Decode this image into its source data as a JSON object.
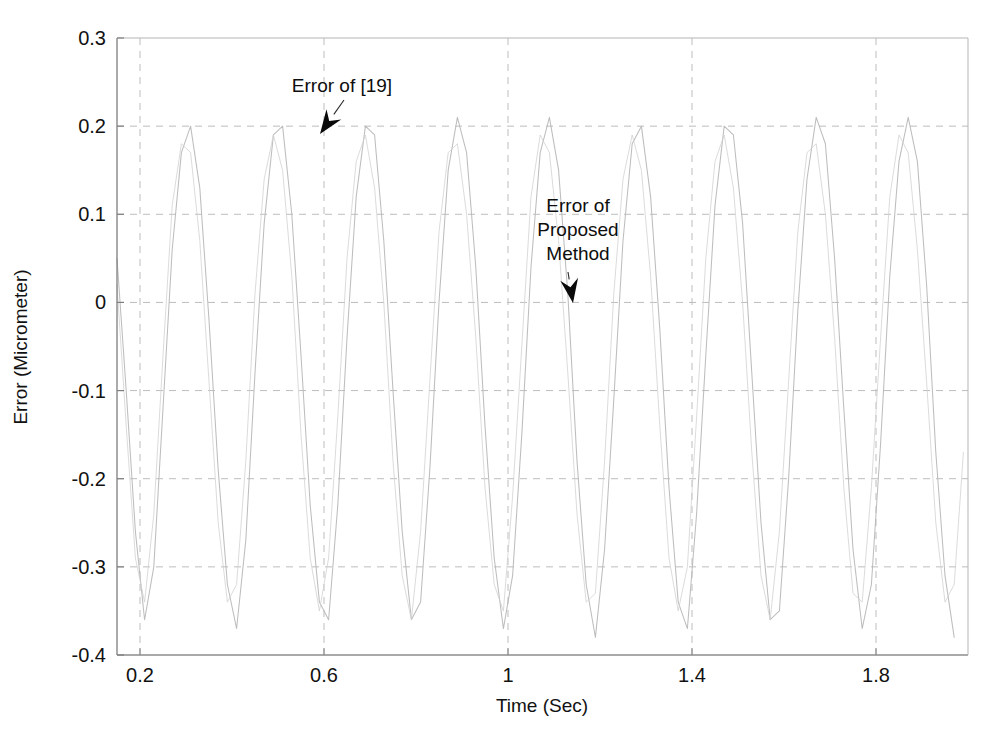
{
  "chart_data": {
    "type": "line",
    "title": "",
    "xlabel": "Time (Sec)",
    "ylabel": "Error (Micrometer)",
    "xlim": [
      0.15,
      2.0
    ],
    "ylim": [
      -0.4,
      0.3
    ],
    "xticks": [
      "0.2",
      "0.6",
      "1",
      "1.4",
      "1.8"
    ],
    "xtick_values": [
      0.2,
      0.6,
      1.0,
      1.4,
      1.8
    ],
    "yticks": [
      "0.3",
      "0.2",
      "0.1",
      "0",
      "-0.1",
      "-0.2",
      "-0.3",
      "-0.4"
    ],
    "ytick_values": [
      0.3,
      0.2,
      0.1,
      0,
      -0.1,
      -0.2,
      -0.3,
      -0.4
    ],
    "grid": true,
    "grid_style": "dashed",
    "legend": "none",
    "series": [
      {
        "name": "Error of [19]",
        "color": "#b9b9b9",
        "period": 0.2,
        "amplitude_max": 0.21,
        "amplitude_min": -0.38,
        "points_t": [
          0.15,
          0.17,
          0.19,
          0.21,
          0.23,
          0.25,
          0.27,
          0.29,
          0.31,
          0.33,
          0.35,
          0.37,
          0.39,
          0.41,
          0.43,
          0.45,
          0.47,
          0.49,
          0.51,
          0.53,
          0.55,
          0.57,
          0.59,
          0.61,
          0.63,
          0.65,
          0.67,
          0.69,
          0.71,
          0.73,
          0.75,
          0.77,
          0.79,
          0.81,
          0.83,
          0.85,
          0.87,
          0.89,
          0.91,
          0.93,
          0.95,
          0.97,
          0.99,
          1.01,
          1.03,
          1.05,
          1.07,
          1.09,
          1.11,
          1.13,
          1.15,
          1.17,
          1.19,
          1.21,
          1.23,
          1.25,
          1.27,
          1.29,
          1.31,
          1.33,
          1.35,
          1.37,
          1.39,
          1.41,
          1.43,
          1.45,
          1.47,
          1.49,
          1.51,
          1.53,
          1.55,
          1.57,
          1.59,
          1.61,
          1.63,
          1.65,
          1.67,
          1.69,
          1.71,
          1.73,
          1.75,
          1.77,
          1.79,
          1.81,
          1.83,
          1.85,
          1.87,
          1.89,
          1.91,
          1.93,
          1.95,
          1.97,
          1.99
        ],
        "points_v": [
          0.05,
          -0.1,
          -0.26,
          -0.36,
          -0.3,
          -0.12,
          0.06,
          0.17,
          0.2,
          0.13,
          -0.02,
          -0.19,
          -0.32,
          -0.37,
          -0.27,
          -0.08,
          0.09,
          0.19,
          0.2,
          0.1,
          -0.06,
          -0.23,
          -0.34,
          -0.36,
          -0.23,
          -0.04,
          0.12,
          0.2,
          0.19,
          0.07,
          -0.1,
          -0.26,
          -0.36,
          -0.34,
          -0.19,
          0.0,
          0.15,
          0.21,
          0.17,
          0.04,
          -0.14,
          -0.29,
          -0.37,
          -0.31,
          -0.15,
          0.04,
          0.17,
          0.21,
          0.15,
          0.01,
          -0.18,
          -0.32,
          -0.38,
          -0.28,
          -0.11,
          0.07,
          0.18,
          0.2,
          0.12,
          -0.03,
          -0.21,
          -0.34,
          -0.37,
          -0.24,
          -0.06,
          0.11,
          0.2,
          0.19,
          0.09,
          -0.08,
          -0.25,
          -0.36,
          -0.35,
          -0.2,
          -0.01,
          0.14,
          0.21,
          0.18,
          0.05,
          -0.12,
          -0.28,
          -0.37,
          -0.32,
          -0.16,
          0.03,
          0.16,
          0.21,
          0.16,
          0.02,
          -0.17,
          -0.31,
          -0.38
        ]
      },
      {
        "name": "Error of Proposed Method",
        "color": "#cfcfcf",
        "period": 0.2,
        "amplitude_max": 0.19,
        "amplitude_min": -0.36,
        "points_t": [
          0.15,
          0.17,
          0.19,
          0.21,
          0.23,
          0.25,
          0.27,
          0.29,
          0.31,
          0.33,
          0.35,
          0.37,
          0.39,
          0.41,
          0.43,
          0.45,
          0.47,
          0.49,
          0.51,
          0.53,
          0.55,
          0.57,
          0.59,
          0.61,
          0.63,
          0.65,
          0.67,
          0.69,
          0.71,
          0.73,
          0.75,
          0.77,
          0.79,
          0.81,
          0.83,
          0.85,
          0.87,
          0.89,
          0.91,
          0.93,
          0.95,
          0.97,
          0.99,
          1.01,
          1.03,
          1.05,
          1.07,
          1.09,
          1.11,
          1.13,
          1.15,
          1.17,
          1.19,
          1.21,
          1.23,
          1.25,
          1.27,
          1.29,
          1.31,
          1.33,
          1.35,
          1.37,
          1.39,
          1.41,
          1.43,
          1.45,
          1.47,
          1.49,
          1.51,
          1.53,
          1.55,
          1.57,
          1.59,
          1.61,
          1.63,
          1.65,
          1.67,
          1.69,
          1.71,
          1.73,
          1.75,
          1.77,
          1.79,
          1.81,
          1.83,
          1.85,
          1.87,
          1.89,
          1.91,
          1.93,
          1.95,
          1.97,
          1.99
        ],
        "points_v": [
          0.02,
          -0.14,
          -0.29,
          -0.34,
          -0.24,
          -0.06,
          0.11,
          0.18,
          0.17,
          0.07,
          -0.09,
          -0.25,
          -0.34,
          -0.32,
          -0.18,
          0.01,
          0.14,
          0.19,
          0.15,
          0.03,
          -0.15,
          -0.29,
          -0.35,
          -0.29,
          -0.13,
          0.05,
          0.16,
          0.19,
          0.13,
          0.0,
          -0.18,
          -0.31,
          -0.36,
          -0.26,
          -0.09,
          0.08,
          0.17,
          0.18,
          0.1,
          -0.04,
          -0.21,
          -0.32,
          -0.35,
          -0.22,
          -0.05,
          0.12,
          0.19,
          0.17,
          0.07,
          -0.08,
          -0.24,
          -0.34,
          -0.33,
          -0.18,
          0.01,
          0.14,
          0.19,
          0.15,
          0.03,
          -0.14,
          -0.29,
          -0.35,
          -0.3,
          -0.13,
          0.05,
          0.16,
          0.19,
          0.13,
          0.0,
          -0.17,
          -0.31,
          -0.36,
          -0.26,
          -0.09,
          0.08,
          0.17,
          0.18,
          0.1,
          -0.04,
          -0.21,
          -0.33,
          -0.34,
          -0.21,
          -0.04,
          0.12,
          0.19,
          0.17,
          0.06,
          -0.09,
          -0.25,
          -0.34,
          -0.32,
          -0.17
        ]
      }
    ],
    "annotations": [
      {
        "id": "annotation-error-of-19",
        "text_lines": [
          "Error of [19]"
        ],
        "text_x": 342,
        "text_y": 92,
        "arrow_from_x": 344,
        "arrow_from_y": 100,
        "arrow_to_x": 320,
        "arrow_to_y": 134
      },
      {
        "id": "annotation-error-of-proposed-method",
        "text_lines": [
          "Error of",
          "Proposed",
          "Method"
        ],
        "text_x": 578,
        "text_y": 212,
        "arrow_from_x": 568,
        "arrow_from_y": 272,
        "arrow_to_x": 573,
        "arrow_to_y": 303
      }
    ]
  },
  "axes": {
    "plot_left": 117,
    "plot_right": 968,
    "plot_top": 38,
    "plot_bottom": 655
  },
  "colors": {
    "background": "#ffffff",
    "axis": "#8a8a8a",
    "grid": "#bdbdbd",
    "text": "#111111",
    "series_a": "#b9b9b9",
    "series_b": "#cfcfcf"
  }
}
